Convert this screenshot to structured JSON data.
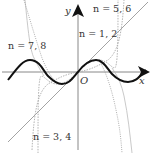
{
  "diagram": {
    "type": "function-plot",
    "axes": {
      "x_label": "x",
      "y_label": "y",
      "origin_label": "O"
    },
    "curves": [
      {
        "name": "sin-x",
        "style": "solid-thick",
        "color": "#111111"
      },
      {
        "name": "taylor-n-1-2",
        "label": "n = 1, 2",
        "style": "solid-thin",
        "color": "#999999"
      },
      {
        "name": "taylor-n-3-4",
        "label": "n = 3, 4",
        "style": "dashed",
        "color": "#aaaaaa"
      },
      {
        "name": "taylor-n-5-6",
        "label": "n = 5, 6",
        "style": "dashed",
        "color": "#aaaaaa"
      },
      {
        "name": "taylor-n-7-8",
        "label": "n = 7, 8",
        "style": "solid-thin",
        "color": "#bbbbbb"
      }
    ]
  },
  "labels": {
    "n12": "n = 1, 2",
    "n34": "n = 3, 4",
    "n56": "n = 5, 6",
    "n78": "n = 7, 8",
    "x": "x",
    "y": "y",
    "O": "O"
  }
}
